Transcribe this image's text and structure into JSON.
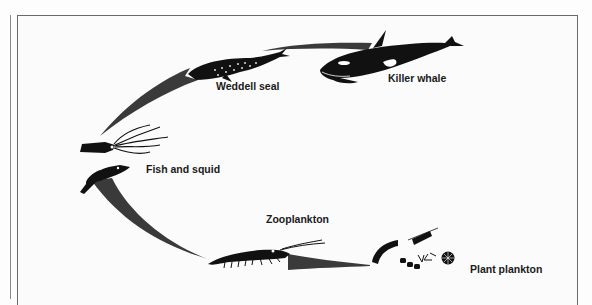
{
  "diagram": {
    "type": "food-chain",
    "nodes": [
      {
        "id": "killer-whale",
        "label": "Killer whale"
      },
      {
        "id": "weddell-seal",
        "label": "Weddell seal"
      },
      {
        "id": "fish-and-squid",
        "label": "Fish and squid"
      },
      {
        "id": "zooplankton",
        "label": "Zooplankton"
      },
      {
        "id": "plant-plankton",
        "label": "Plant plankton"
      }
    ],
    "edges": [
      {
        "from": "plant-plankton",
        "to": "zooplankton"
      },
      {
        "from": "zooplankton",
        "to": "fish-and-squid"
      },
      {
        "from": "fish-and-squid",
        "to": "weddell-seal"
      },
      {
        "from": "weddell-seal",
        "to": "killer-whale"
      }
    ],
    "colors": {
      "arrow": "#3a3a3a",
      "animal": "#111111",
      "frame": "#6a6a6a",
      "background": "#fbfbfb"
    }
  }
}
